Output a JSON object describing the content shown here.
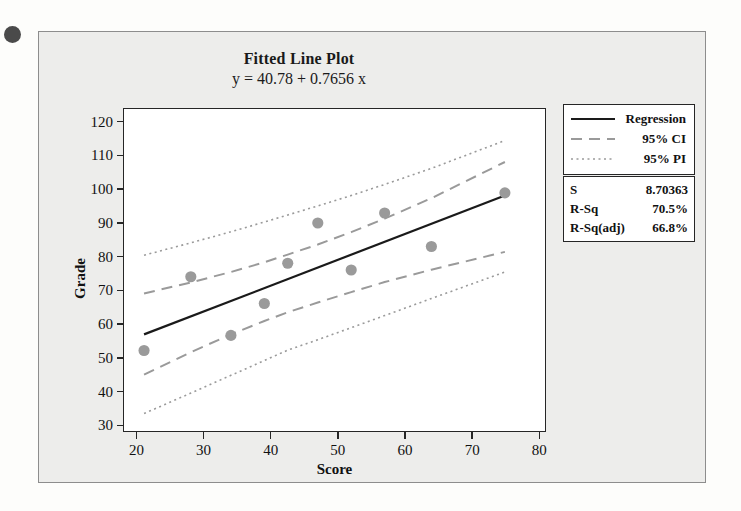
{
  "figure": {
    "title": "Fitted Line Plot",
    "subtitle": "y = 40.78 + 0.7656 x"
  },
  "legend": {
    "items": [
      {
        "label": "Regression",
        "style": "solid",
        "color": "#1a1a1a"
      },
      {
        "label": "95% CI",
        "style": "dashed",
        "color": "#9a9a9a"
      },
      {
        "label": "95% PI",
        "style": "dotted",
        "color": "#9a9a9a"
      }
    ]
  },
  "stats": {
    "rows": [
      {
        "key": "S",
        "value": "8.70363"
      },
      {
        "key": "R-Sq",
        "value": "70.5%"
      },
      {
        "key": "R-Sq(adj)",
        "value": "66.8%"
      }
    ]
  },
  "chart_data": {
    "type": "scatter",
    "title": "Fitted Line Plot",
    "subtitle": "y = 40.78 + 0.7656 x",
    "xlabel": "Score",
    "ylabel": "Grade",
    "xlim": [
      18,
      81
    ],
    "ylim": [
      28,
      124
    ],
    "xticks": [
      20,
      30,
      40,
      50,
      60,
      70,
      80
    ],
    "yticks": [
      30,
      40,
      50,
      60,
      70,
      80,
      90,
      100,
      110,
      120
    ],
    "grid": false,
    "legend_position": "right-top",
    "marker_color": "#9a9a9a",
    "regression_color": "#1a1a1a",
    "interval_color": "#9a9a9a",
    "fit": {
      "intercept": 40.78,
      "slope": 0.7656
    },
    "x": [
      21,
      28,
      34,
      39,
      42.5,
      47,
      52,
      57,
      64,
      75
    ],
    "y": [
      52,
      74,
      56.5,
      66,
      78,
      90,
      76,
      93,
      83,
      99
    ],
    "points": [
      {
        "score": 21,
        "grade": 52
      },
      {
        "score": 28,
        "grade": 74
      },
      {
        "score": 34,
        "grade": 56.5
      },
      {
        "score": 39,
        "grade": 66
      },
      {
        "score": 42.5,
        "grade": 78
      },
      {
        "score": 47,
        "grade": 90
      },
      {
        "score": 52,
        "grade": 76
      },
      {
        "score": 57,
        "grade": 93
      },
      {
        "score": 64,
        "grade": 83
      },
      {
        "score": 75,
        "grade": 99
      }
    ],
    "series": [
      {
        "name": "Regression",
        "type": "line",
        "x": [
          21,
          75
        ],
        "y": [
          56.8,
          98.2
        ]
      },
      {
        "name": "95% CI upper",
        "type": "line",
        "x": [
          21,
          28,
          34,
          39,
          42.5,
          47,
          52,
          57,
          64,
          75
        ],
        "y": [
          69.0,
          72.3,
          75.4,
          78.3,
          80.6,
          83.6,
          87.3,
          91.3,
          97.4,
          108.2
        ]
      },
      {
        "name": "95% CI lower",
        "type": "line",
        "x": [
          21,
          28,
          34,
          39,
          42.5,
          47,
          52,
          57,
          64,
          75
        ],
        "y": [
          44.8,
          51.5,
          56.8,
          60.8,
          63.4,
          66.3,
          69.4,
          72.4,
          76.1,
          81.4
        ]
      },
      {
        "name": "95% PI upper",
        "type": "line",
        "x": [
          21,
          28,
          34,
          39,
          42.5,
          47,
          52,
          57,
          64,
          75
        ],
        "y": [
          80.4,
          84.1,
          87.4,
          90.3,
          92.4,
          95.1,
          98.2,
          101.5,
          106.3,
          114.6
        ]
      },
      {
        "name": "95% PI lower",
        "type": "line",
        "x": [
          21,
          28,
          34,
          39,
          42.5,
          47,
          52,
          57,
          64,
          75
        ],
        "y": [
          33.2,
          39.3,
          44.6,
          49.0,
          52.1,
          55.2,
          58.8,
          62.4,
          67.5,
          75.4
        ]
      }
    ],
    "annotations": [
      {
        "text": "S",
        "value": "8.70363"
      },
      {
        "text": "R-Sq",
        "value": "70.5%"
      },
      {
        "text": "R-Sq(adj)",
        "value": "66.8%"
      }
    ]
  }
}
